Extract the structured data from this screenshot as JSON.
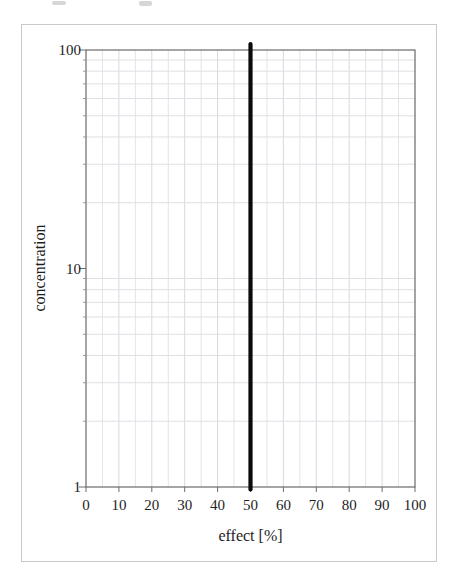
{
  "figure": {
    "background": "#ffffff",
    "border_color": "#c9c9c9"
  },
  "chart_data": {
    "type": "line",
    "title": "",
    "xlabel": "effect [%]",
    "ylabel": "concentration",
    "xlim": [
      0,
      100
    ],
    "ylim": [
      1,
      100
    ],
    "x_scale": "linear",
    "y_scale": "log",
    "x_tick_values": [
      0,
      10,
      20,
      30,
      40,
      50,
      60,
      70,
      80,
      90,
      100
    ],
    "x_tick_labels": [
      "0",
      "10",
      "20",
      "30",
      "40",
      "50",
      "60",
      "70",
      "80",
      "90",
      "100"
    ],
    "y_tick_values": [
      1,
      10,
      100
    ],
    "y_tick_labels": [
      "1",
      "10",
      "100"
    ],
    "grid": {
      "on": true,
      "x_step": 5,
      "x_major_step": 10,
      "y_minor": [
        2,
        3,
        4,
        5,
        6,
        7,
        8,
        9,
        20,
        30,
        40,
        50,
        60,
        70,
        80,
        90
      ],
      "color_major": "#d7d9de",
      "color_minor": "#e3e4e8",
      "color_horizontal": "#dde0e4"
    },
    "series": [
      {
        "name": "EC50 vertical line",
        "description": "vertical line at effect = 50% spanning concentration 1 to 100",
        "x": [
          50,
          50
        ],
        "y": [
          1,
          100
        ],
        "color": "#0a0a0a",
        "stroke_width": 4.2
      }
    ],
    "axis_color": "#6a6a6a",
    "tick_color": "#6a6a6a",
    "minor_tick_color": "#9a9a9a",
    "text_color": "#1e1e1e",
    "legend": null
  }
}
